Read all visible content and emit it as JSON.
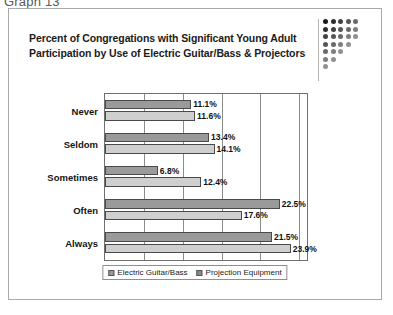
{
  "caption": "Graph 13",
  "chart_data": {
    "type": "bar",
    "orientation": "horizontal",
    "title": "Percent of Congregations with Significant Young Adult Participation by Use of Electric Guitar/Bass & Projectors",
    "title_lines": [
      "Percent of Congregations with Significant Young Adult",
      "Participation by Use of Electric Guitar/Bass & Projectors"
    ],
    "categories": [
      "Never",
      "Seldom",
      "Sometimes",
      "Often",
      "Always"
    ],
    "series": [
      {
        "name": "Electric Guitar/Bass",
        "values": [
          11.1,
          13.4,
          6.8,
          22.5,
          21.5
        ],
        "labels": [
          "11.1%",
          "13.4%",
          "6.8%",
          "22.5%",
          "21.5%"
        ],
        "color": "#9a9a9a"
      },
      {
        "name": "Projection Equipment",
        "values": [
          11.6,
          14.1,
          12.4,
          17.6,
          23.9
        ],
        "labels": [
          "11.6%",
          "14.1%",
          "12.4%",
          "17.6%",
          "23.9%"
        ],
        "color": "#cfcfcf"
      }
    ],
    "xlabel": "",
    "ylabel": "",
    "xlim": [
      0,
      26
    ],
    "gridlines": [
      5,
      10,
      15,
      20,
      25
    ],
    "grid": true,
    "axis_tick_labels_visible": false,
    "legend_position": "bottom",
    "legend": [
      "Electric Guitar/Bass",
      "Projection Equipment"
    ]
  },
  "decor": {
    "dot_matrix_name": "dot-matrix-decoration"
  }
}
